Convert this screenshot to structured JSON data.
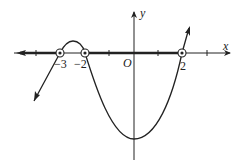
{
  "diagram": {
    "type": "sign-chart / polynomial graph on number line",
    "axes": {
      "x_label": "x",
      "y_label": "y",
      "origin_label": "O"
    },
    "roots": [
      {
        "value": -3,
        "label": "−3",
        "marker": "open-circle"
      },
      {
        "value": -2,
        "label": "−2",
        "marker": "open-circle"
      },
      {
        "value": 2,
        "label": "2",
        "marker": "open-circle"
      }
    ],
    "tick_positions": [
      -4,
      -3,
      -2,
      -1,
      0,
      1,
      2,
      3
    ],
    "highlighted_intervals": [
      {
        "from": "-inf",
        "to": -3
      },
      {
        "from": -2,
        "to": 2
      }
    ],
    "curve_description": "Passes up through x=-3, small hump above axis between -3 and -2, crosses down at -2, minimum below origin near x=0, rises through x=2 and continues up",
    "colors": {
      "ink": "#222222",
      "background": "#ffffff"
    }
  }
}
